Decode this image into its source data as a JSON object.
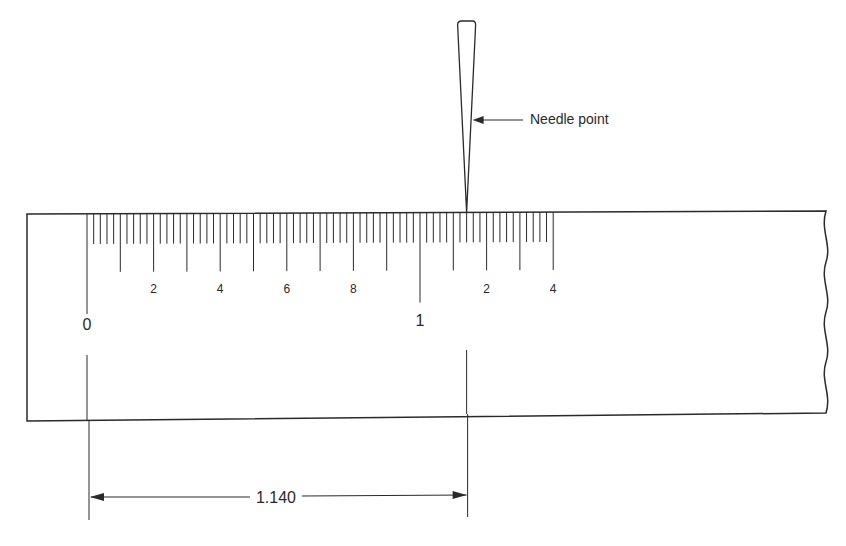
{
  "diagram": {
    "type": "scale-reading",
    "needle_label": "Needle point",
    "scale": {
      "major_labels": [
        "0",
        "1"
      ],
      "minor_labels": [
        "2",
        "4",
        "6",
        "8",
        "2",
        "4"
      ],
      "minor_label_values": [
        0.2,
        0.4,
        0.6,
        0.8,
        1.2,
        1.4
      ],
      "range": [
        0,
        1.4
      ],
      "fine_division": 0.02,
      "medium_division": 0.1
    },
    "needle_reading": 1.14,
    "dimension": {
      "label": "1.140",
      "from": 0,
      "to": 1.14
    },
    "ink_color": "#2a2a2a"
  }
}
